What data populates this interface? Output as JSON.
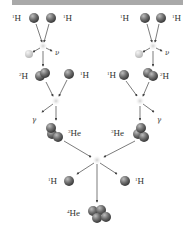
{
  "diagram": {
    "topic": "proton-proton chain",
    "colors": {
      "top_bar": "#a9a9a9",
      "proton": "#6e6e6e",
      "positron": "#d8d8d8",
      "reaction_glow": "#c0c0c0",
      "arrow": "#444444",
      "label": "#333333"
    },
    "top_left": {
      "protons": [
        {
          "mass": "1",
          "symbol": "H"
        },
        {
          "mass": "1",
          "symbol": "H"
        }
      ],
      "positron_label": "",
      "neutrino_label": "ν"
    },
    "top_right": {
      "protons": [
        {
          "mass": "1",
          "symbol": "H"
        },
        {
          "mass": "1",
          "symbol": "H"
        }
      ],
      "neutrino_label": "ν"
    },
    "mid_left": {
      "deuterium": {
        "mass": "2",
        "symbol": "H"
      },
      "proton": {
        "mass": "1",
        "symbol": "H"
      },
      "gamma_label": "γ"
    },
    "mid_right": {
      "proton": {
        "mass": "1",
        "symbol": "H"
      },
      "deuterium": {
        "mass": "2",
        "symbol": "H"
      },
      "gamma_label": "γ"
    },
    "helium3_left": {
      "mass": "3",
      "symbol": "He"
    },
    "helium3_right": {
      "mass": "3",
      "symbol": "He"
    },
    "products": {
      "proton_left": {
        "mass": "1",
        "symbol": "H"
      },
      "proton_right": {
        "mass": "1",
        "symbol": "H"
      },
      "helium4": {
        "mass": "4",
        "symbol": "He"
      }
    }
  }
}
